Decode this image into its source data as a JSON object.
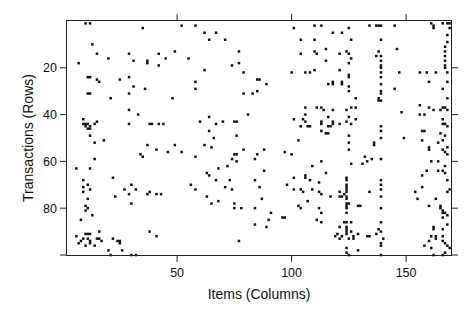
{
  "chart_data": {
    "type": "scatter",
    "subtype": "binary-matrix-image",
    "title": "",
    "xlabel": "Items (Columns)",
    "ylabel": "Transactions (Rows)",
    "xlim": [
      1,
      169
    ],
    "ylim": [
      100,
      0
    ],
    "y_inverted": true,
    "grid": false,
    "legend": null,
    "x_ticks": [
      50,
      100,
      150
    ],
    "x_tick_labels": [
      "50",
      "100",
      "150"
    ],
    "y_ticks": [
      20,
      40,
      60,
      80,
      100
    ],
    "y_tick_labels": [
      "20",
      "40",
      "60",
      "80",
      ""
    ],
    "marker": {
      "shape": "square",
      "size": 2.5,
      "color": "#111111"
    },
    "points": [
      [
        10,
        1
      ],
      [
        12,
        1
      ],
      [
        35,
        3
      ],
      [
        13,
        10
      ],
      [
        15,
        14
      ],
      [
        29,
        14
      ],
      [
        42,
        14
      ],
      [
        45,
        16
      ],
      [
        20,
        16
      ],
      [
        7,
        18
      ],
      [
        31,
        17
      ],
      [
        37,
        17
      ],
      [
        37,
        18
      ],
      [
        42,
        19
      ],
      [
        11,
        24
      ],
      [
        12,
        24
      ],
      [
        15,
        25
      ],
      [
        16,
        26
      ],
      [
        25,
        25
      ],
      [
        29,
        24
      ],
      [
        31,
        28
      ],
      [
        36,
        29
      ],
      [
        11,
        31
      ],
      [
        12,
        31
      ],
      [
        29,
        31
      ],
      [
        21,
        33
      ],
      [
        48,
        33
      ],
      [
        9,
        42
      ],
      [
        10,
        44
      ],
      [
        11,
        44
      ],
      [
        9,
        44
      ],
      [
        12,
        45
      ],
      [
        14,
        44
      ],
      [
        10,
        45
      ],
      [
        11,
        46
      ],
      [
        12,
        46
      ],
      [
        12,
        49
      ],
      [
        15,
        43
      ],
      [
        14,
        52
      ],
      [
        18,
        51
      ],
      [
        29,
        38
      ],
      [
        33,
        40
      ],
      [
        29,
        44
      ],
      [
        38,
        44
      ],
      [
        39,
        44
      ],
      [
        42,
        44
      ],
      [
        44,
        44
      ],
      [
        37,
        53
      ],
      [
        41,
        55
      ],
      [
        49,
        53
      ],
      [
        6,
        63
      ],
      [
        12,
        63
      ],
      [
        14,
        59
      ],
      [
        34,
        57
      ],
      [
        35,
        58
      ],
      [
        46,
        56
      ],
      [
        9,
        71
      ],
      [
        9,
        68
      ],
      [
        11,
        70
      ],
      [
        12,
        72
      ],
      [
        9,
        73
      ],
      [
        22,
        67
      ],
      [
        23,
        75
      ],
      [
        27,
        72
      ],
      [
        29,
        74
      ],
      [
        30,
        70
      ],
      [
        32,
        72
      ],
      [
        37,
        74
      ],
      [
        38,
        73
      ],
      [
        30,
        78
      ],
      [
        41,
        74
      ],
      [
        43,
        74
      ],
      [
        11,
        76
      ],
      [
        10,
        79
      ],
      [
        11,
        80
      ],
      [
        10,
        81
      ],
      [
        8,
        85
      ],
      [
        13,
        83
      ],
      [
        16,
        90
      ],
      [
        11,
        91
      ],
      [
        12,
        91
      ],
      [
        10,
        91
      ],
      [
        11,
        93
      ],
      [
        9,
        93
      ],
      [
        12,
        94
      ],
      [
        12,
        95
      ],
      [
        16,
        93
      ],
      [
        17,
        94
      ],
      [
        15,
        93
      ],
      [
        20,
        98
      ],
      [
        25,
        95
      ],
      [
        25,
        94
      ],
      [
        24,
        94
      ],
      [
        8,
        94
      ],
      [
        6,
        92
      ],
      [
        7,
        95
      ],
      [
        10,
        96
      ],
      [
        14,
        96
      ],
      [
        21,
        100
      ],
      [
        22,
        93
      ],
      [
        26,
        98
      ],
      [
        30,
        100
      ],
      [
        32,
        100
      ],
      [
        38,
        90
      ],
      [
        41,
        92
      ],
      [
        52,
        2
      ],
      [
        58,
        2
      ],
      [
        62,
        5
      ],
      [
        67,
        5
      ],
      [
        71,
        8
      ],
      [
        77,
        13
      ],
      [
        64,
        8
      ],
      [
        49,
        13
      ],
      [
        55,
        16
      ],
      [
        62,
        21
      ],
      [
        74,
        19
      ],
      [
        77,
        18
      ],
      [
        79,
        22
      ],
      [
        85,
        25
      ],
      [
        85,
        30
      ],
      [
        89,
        27
      ],
      [
        86,
        25
      ],
      [
        58,
        26
      ],
      [
        58,
        29
      ],
      [
        79,
        31
      ],
      [
        83,
        31
      ],
      [
        64,
        41
      ],
      [
        60,
        43
      ],
      [
        70,
        43
      ],
      [
        75,
        43
      ],
      [
        76,
        43
      ],
      [
        81,
        40
      ],
      [
        64,
        47
      ],
      [
        66,
        50
      ],
      [
        76,
        49
      ],
      [
        65,
        54
      ],
      [
        62,
        53
      ],
      [
        52,
        56
      ],
      [
        58,
        58
      ],
      [
        67,
        44
      ],
      [
        75,
        57
      ],
      [
        88,
        55
      ],
      [
        85,
        57
      ],
      [
        76,
        57
      ],
      [
        56,
        70
      ],
      [
        58,
        72
      ],
      [
        63,
        65
      ],
      [
        64,
        66
      ],
      [
        68,
        63
      ],
      [
        72,
        62
      ],
      [
        76,
        60
      ],
      [
        79,
        55
      ],
      [
        74,
        59
      ],
      [
        84,
        59
      ],
      [
        84,
        68
      ],
      [
        86,
        71
      ],
      [
        88,
        64
      ],
      [
        71,
        71
      ],
      [
        74,
        72
      ],
      [
        73,
        68
      ],
      [
        67,
        68
      ],
      [
        63,
        75
      ],
      [
        68,
        77
      ],
      [
        75,
        78
      ],
      [
        84,
        80
      ],
      [
        87,
        76
      ],
      [
        65,
        78
      ],
      [
        75,
        80
      ],
      [
        78,
        80
      ],
      [
        84,
        87
      ],
      [
        77,
        94
      ],
      [
        89,
        88
      ],
      [
        90,
        85
      ],
      [
        91,
        82
      ],
      [
        101,
        3
      ],
      [
        110,
        2
      ],
      [
        113,
        2
      ],
      [
        118,
        5
      ],
      [
        122,
        5
      ],
      [
        115,
        12
      ],
      [
        104,
        8
      ],
      [
        110,
        8
      ],
      [
        104,
        14
      ],
      [
        110,
        13
      ],
      [
        111,
        14
      ],
      [
        121,
        14
      ],
      [
        124,
        13
      ],
      [
        121,
        21
      ],
      [
        115,
        17
      ],
      [
        100,
        22
      ],
      [
        106,
        22
      ],
      [
        108,
        22
      ],
      [
        110,
        21
      ],
      [
        116,
        27
      ],
      [
        118,
        26
      ],
      [
        118,
        27
      ],
      [
        122,
        27
      ],
      [
        122,
        26
      ],
      [
        125,
        24
      ],
      [
        106,
        37
      ],
      [
        113,
        37
      ],
      [
        111,
        37
      ],
      [
        118,
        38
      ],
      [
        116,
        41
      ],
      [
        101,
        42
      ],
      [
        105,
        42
      ],
      [
        106,
        40
      ],
      [
        106,
        43
      ],
      [
        114,
        38
      ],
      [
        113,
        43
      ],
      [
        118,
        43
      ],
      [
        121,
        44
      ],
      [
        116,
        48
      ],
      [
        103,
        51
      ],
      [
        113,
        44
      ],
      [
        118,
        44
      ],
      [
        107,
        45
      ],
      [
        104,
        45
      ],
      [
        108,
        45
      ],
      [
        113,
        47
      ],
      [
        115,
        48
      ],
      [
        116,
        45
      ],
      [
        117,
        45
      ],
      [
        100,
        57
      ],
      [
        97,
        56
      ],
      [
        109,
        62
      ],
      [
        113,
        60
      ],
      [
        115,
        65
      ],
      [
        101,
        67
      ],
      [
        98,
        70
      ],
      [
        101,
        72
      ],
      [
        104,
        72
      ],
      [
        106,
        67
      ],
      [
        106,
        66
      ],
      [
        109,
        72
      ],
      [
        108,
        68
      ],
      [
        112,
        69
      ],
      [
        112,
        73
      ],
      [
        113,
        74
      ],
      [
        105,
        73
      ],
      [
        117,
        75
      ],
      [
        121,
        73
      ],
      [
        124,
        79
      ],
      [
        107,
        77
      ],
      [
        103,
        79
      ],
      [
        104,
        80
      ],
      [
        112,
        80
      ],
      [
        113,
        82
      ],
      [
        111,
        85
      ],
      [
        121,
        88
      ],
      [
        123,
        86
      ],
      [
        126,
        86
      ],
      [
        96,
        84
      ],
      [
        97,
        84
      ],
      [
        113,
        86
      ],
      [
        120,
        91
      ],
      [
        119,
        92
      ],
      [
        122,
        92
      ],
      [
        126,
        90
      ],
      [
        129,
        91
      ],
      [
        127,
        92
      ],
      [
        127,
        93
      ],
      [
        121,
        93
      ],
      [
        129,
        98
      ],
      [
        125,
        3
      ],
      [
        125,
        14
      ],
      [
        126,
        8
      ],
      [
        126,
        16
      ],
      [
        125,
        18
      ],
      [
        125,
        23
      ],
      [
        125,
        28
      ],
      [
        125,
        30
      ],
      [
        128,
        33
      ],
      [
        124,
        38
      ],
      [
        126,
        37
      ],
      [
        128,
        37
      ],
      [
        125,
        41
      ],
      [
        124,
        43
      ],
      [
        128,
        42
      ],
      [
        126,
        44
      ],
      [
        125,
        49
      ],
      [
        125,
        52
      ],
      [
        125,
        55
      ],
      [
        126,
        61
      ],
      [
        134,
        2
      ],
      [
        137,
        2
      ],
      [
        138,
        2
      ],
      [
        139,
        2
      ],
      [
        139,
        8
      ],
      [
        138,
        13
      ],
      [
        137,
        15
      ],
      [
        139,
        15
      ],
      [
        139,
        17
      ],
      [
        139,
        19
      ],
      [
        139,
        20
      ],
      [
        139,
        22
      ],
      [
        139,
        24
      ],
      [
        139,
        27
      ],
      [
        139,
        30
      ],
      [
        139,
        31
      ],
      [
        138,
        33
      ],
      [
        138,
        34
      ],
      [
        139,
        34
      ],
      [
        139,
        45
      ],
      [
        139,
        47
      ],
      [
        139,
        50
      ],
      [
        136,
        52
      ],
      [
        136,
        53
      ],
      [
        133,
        60
      ],
      [
        131,
        61
      ],
      [
        132,
        58
      ],
      [
        135,
        59
      ],
      [
        139,
        59
      ],
      [
        124,
        67
      ],
      [
        124,
        68
      ],
      [
        124,
        70
      ],
      [
        124,
        71
      ],
      [
        124,
        72
      ],
      [
        124,
        73
      ],
      [
        124,
        75
      ],
      [
        124,
        76
      ],
      [
        124,
        78
      ],
      [
        125,
        78
      ],
      [
        124,
        80
      ],
      [
        124,
        82
      ],
      [
        123,
        74
      ],
      [
        122,
        75
      ],
      [
        121,
        75
      ],
      [
        129,
        79
      ],
      [
        130,
        79
      ],
      [
        134,
        73
      ],
      [
        124,
        86
      ],
      [
        124,
        88
      ],
      [
        124,
        89
      ],
      [
        124,
        90
      ],
      [
        124,
        91
      ],
      [
        125,
        93
      ],
      [
        124,
        97
      ],
      [
        124,
        99
      ],
      [
        125,
        100
      ],
      [
        139,
        68
      ],
      [
        139,
        70
      ],
      [
        139,
        72
      ],
      [
        139,
        75
      ],
      [
        139,
        80
      ],
      [
        139,
        86
      ],
      [
        139,
        90
      ],
      [
        138,
        89
      ],
      [
        139,
        96
      ],
      [
        139,
        100
      ],
      [
        133,
        92
      ],
      [
        134,
        92
      ],
      [
        137,
        91
      ],
      [
        139,
        95
      ],
      [
        140,
        93
      ],
      [
        145,
        2
      ],
      [
        147,
        22
      ],
      [
        146,
        12
      ],
      [
        145,
        29
      ],
      [
        148,
        39
      ],
      [
        149,
        50
      ],
      [
        156,
        22
      ],
      [
        159,
        22
      ],
      [
        160,
        26
      ],
      [
        163,
        22
      ],
      [
        156,
        36
      ],
      [
        156,
        40
      ],
      [
        160,
        37
      ],
      [
        162,
        38
      ],
      [
        165,
        38
      ],
      [
        158,
        40
      ],
      [
        157,
        47
      ],
      [
        158,
        47
      ],
      [
        165,
        48
      ],
      [
        164,
        52
      ],
      [
        157,
        51
      ],
      [
        160,
        54
      ],
      [
        160,
        55
      ],
      [
        166,
        55
      ],
      [
        167,
        56
      ],
      [
        161,
        60
      ],
      [
        164,
        60
      ],
      [
        164,
        64
      ],
      [
        157,
        66
      ],
      [
        159,
        64
      ],
      [
        166,
        64
      ],
      [
        161,
        1
      ],
      [
        162,
        2
      ],
      [
        162,
        3
      ],
      [
        166,
        1
      ],
      [
        168,
        1
      ],
      [
        169,
        1
      ],
      [
        169,
        3
      ],
      [
        168,
        6
      ],
      [
        168,
        9
      ],
      [
        167,
        11
      ],
      [
        167,
        13
      ],
      [
        167,
        15
      ],
      [
        167,
        17
      ],
      [
        167,
        19
      ],
      [
        167,
        20
      ],
      [
        168,
        22
      ],
      [
        168,
        26
      ],
      [
        166,
        29
      ],
      [
        168,
        33
      ],
      [
        166,
        37
      ],
      [
        167,
        37
      ],
      [
        168,
        38
      ],
      [
        166,
        42
      ],
      [
        166,
        44
      ],
      [
        167,
        44
      ],
      [
        168,
        45
      ],
      [
        167,
        49
      ],
      [
        166,
        51
      ],
      [
        168,
        54
      ],
      [
        168,
        57
      ],
      [
        167,
        62
      ],
      [
        167,
        65
      ],
      [
        168,
        68
      ],
      [
        169,
        72
      ],
      [
        168,
        73
      ],
      [
        157,
        71
      ],
      [
        154,
        73
      ],
      [
        155,
        76
      ],
      [
        160,
        79
      ],
      [
        163,
        76
      ],
      [
        165,
        79
      ],
      [
        165,
        80
      ],
      [
        166,
        81
      ],
      [
        166,
        82
      ],
      [
        167,
        82
      ],
      [
        166,
        84
      ],
      [
        168,
        83
      ],
      [
        168,
        87
      ],
      [
        166,
        89
      ],
      [
        166,
        92
      ],
      [
        166,
        94
      ],
      [
        167,
        95
      ],
      [
        168,
        96
      ],
      [
        169,
        97
      ],
      [
        167,
        99
      ],
      [
        166,
        100
      ],
      [
        162,
        88
      ],
      [
        162,
        89
      ],
      [
        161,
        92
      ],
      [
        163,
        92
      ],
      [
        163,
        93
      ],
      [
        160,
        94
      ],
      [
        161,
        97
      ],
      [
        158,
        96
      ],
      [
        162,
        100
      ]
    ]
  },
  "plot": {
    "x_axis_title": "Items (Columns)",
    "y_axis_title": "Transactions (Rows)",
    "background": "#ffffff",
    "frame_color": "#222222"
  }
}
